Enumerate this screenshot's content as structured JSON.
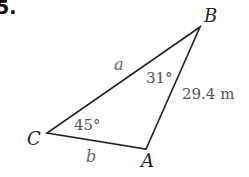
{
  "problem": {
    "number": "5."
  },
  "triangle": {
    "vertices": [
      {
        "name": "B",
        "label": "B"
      },
      {
        "name": "C",
        "label": "C"
      },
      {
        "name": "A",
        "label": "A"
      }
    ],
    "sides": {
      "CB": "a",
      "CA": "b",
      "AB": "29.4 m"
    },
    "angles": {
      "B": "31°",
      "C": "45°"
    }
  },
  "colors": {
    "line": "#222222",
    "label": "#555555"
  }
}
